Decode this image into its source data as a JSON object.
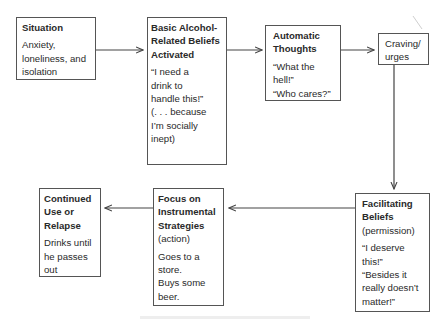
{
  "diagram": {
    "nodes": [
      {
        "id": "situation",
        "title": "Situation",
        "body": [
          "Anxiety,",
          "loneliness, and",
          "isolation"
        ]
      },
      {
        "id": "basic-beliefs",
        "title": "Basic Alcohol-Related Beliefs Activated",
        "body": [
          "“I need a",
          "drink to",
          "handle this!”",
          "(. . . because",
          "I’m socially",
          "inept)"
        ]
      },
      {
        "id": "automatic-thoughts",
        "title": "Automatic Thoughts",
        "body": [
          "“What the",
          "hell!”",
          "“Who cares?”"
        ]
      },
      {
        "id": "craving",
        "title": "Craving/ urges",
        "body": []
      },
      {
        "id": "facilitating-beliefs",
        "title": "Facilitating Beliefs",
        "subtitle": "(permission)",
        "body": [
          "“I deserve",
          "this!”",
          "“Besides it",
          "really doesn’t",
          "matter!”"
        ]
      },
      {
        "id": "instrumental-strategies",
        "title": "Focus on Instrumental Strategies",
        "subtitle": "(action)",
        "body": [
          "Goes to a",
          "store.",
          "Buys some",
          "beer."
        ]
      },
      {
        "id": "continued-use",
        "title": "Continued Use or Relapse",
        "body": [
          "Drinks until",
          "he passes",
          "out"
        ]
      }
    ],
    "edges": [
      {
        "from": "situation",
        "to": "basic-beliefs"
      },
      {
        "from": "basic-beliefs",
        "to": "automatic-thoughts"
      },
      {
        "from": "automatic-thoughts",
        "to": "craving"
      },
      {
        "from": "craving",
        "to": "facilitating-beliefs"
      },
      {
        "from": "facilitating-beliefs",
        "to": "instrumental-strategies"
      },
      {
        "from": "instrumental-strategies",
        "to": "continued-use"
      }
    ],
    "colors": {
      "line": "#444444",
      "border": "#555555",
      "text": "#2a2a2a"
    }
  }
}
